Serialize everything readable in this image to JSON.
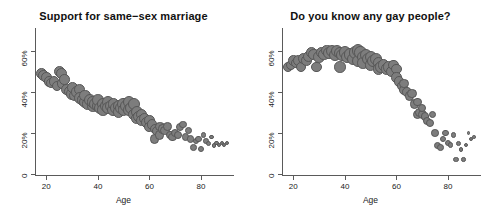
{
  "figure": {
    "background": "#ffffff",
    "point_fill": "#7d7d7d",
    "point_stroke": "#575757"
  },
  "panels": [
    {
      "id": "support-same-sex-marriage",
      "title": "Support for same−sex marriage",
      "xlabel": "Age",
      "yticks": [
        "0",
        "20%",
        "40%",
        "60%"
      ],
      "xticks": [
        "20",
        "40",
        "60",
        "80"
      ]
    },
    {
      "id": "know-any-gay-people",
      "title": "Do you know any gay people?",
      "xlabel": "Age",
      "yticks": [
        "0",
        "20%",
        "40%",
        "60%"
      ],
      "xticks": [
        "20",
        "40",
        "60",
        "80"
      ]
    }
  ],
  "chart_data": [
    {
      "type": "scatter",
      "title": "Support for same−sex marriage",
      "xlabel": "Age",
      "ylabel": "",
      "xlim": [
        16,
        92
      ],
      "ylim": [
        0,
        70
      ],
      "ytick_values": [
        0,
        20,
        40,
        60
      ],
      "ytick_labels": [
        "0",
        "20%",
        "40%",
        "60%"
      ],
      "xtick_values": [
        20,
        40,
        60,
        80
      ],
      "xtick_labels": [
        "20",
        "40",
        "60",
        "80"
      ],
      "grid": false,
      "legend": null,
      "size_encoding": "bubble area proportional to sample size (respondents per age)",
      "points": [
        {
          "x": 18,
          "y": 49,
          "s": 5.4
        },
        {
          "x": 19,
          "y": 48,
          "s": 5.4
        },
        {
          "x": 20,
          "y": 47,
          "s": 5.2
        },
        {
          "x": 21,
          "y": 45,
          "s": 5.2
        },
        {
          "x": 22,
          "y": 44,
          "s": 5.0
        },
        {
          "x": 23,
          "y": 45,
          "s": 5.2
        },
        {
          "x": 24,
          "y": 43,
          "s": 5.0
        },
        {
          "x": 25,
          "y": 50,
          "s": 5.6
        },
        {
          "x": 26,
          "y": 49,
          "s": 5.4
        },
        {
          "x": 26,
          "y": 44,
          "s": 5.2
        },
        {
          "x": 27,
          "y": 46,
          "s": 5.2
        },
        {
          "x": 28,
          "y": 41,
          "s": 5.6
        },
        {
          "x": 29,
          "y": 40,
          "s": 5.4
        },
        {
          "x": 30,
          "y": 39,
          "s": 5.8
        },
        {
          "x": 30,
          "y": 42,
          "s": 5.4
        },
        {
          "x": 31,
          "y": 38,
          "s": 5.6
        },
        {
          "x": 32,
          "y": 40,
          "s": 5.8
        },
        {
          "x": 33,
          "y": 41,
          "s": 5.6
        },
        {
          "x": 33,
          "y": 37,
          "s": 5.8
        },
        {
          "x": 34,
          "y": 36,
          "s": 5.6
        },
        {
          "x": 35,
          "y": 35,
          "s": 6.0
        },
        {
          "x": 35,
          "y": 38,
          "s": 5.6
        },
        {
          "x": 36,
          "y": 34,
          "s": 5.8
        },
        {
          "x": 37,
          "y": 36,
          "s": 6.0
        },
        {
          "x": 38,
          "y": 33,
          "s": 5.8
        },
        {
          "x": 38,
          "y": 35,
          "s": 5.6
        },
        {
          "x": 39,
          "y": 34,
          "s": 6.0
        },
        {
          "x": 40,
          "y": 33,
          "s": 6.2
        },
        {
          "x": 40,
          "y": 36,
          "s": 5.8
        },
        {
          "x": 41,
          "y": 32,
          "s": 6.0
        },
        {
          "x": 42,
          "y": 34,
          "s": 6.2
        },
        {
          "x": 42,
          "y": 31,
          "s": 5.8
        },
        {
          "x": 43,
          "y": 33,
          "s": 6.0
        },
        {
          "x": 44,
          "y": 35,
          "s": 6.2
        },
        {
          "x": 44,
          "y": 32,
          "s": 5.8
        },
        {
          "x": 45,
          "y": 33,
          "s": 6.2
        },
        {
          "x": 46,
          "y": 31,
          "s": 6.0
        },
        {
          "x": 46,
          "y": 34,
          "s": 5.8
        },
        {
          "x": 47,
          "y": 32,
          "s": 6.2
        },
        {
          "x": 48,
          "y": 33,
          "s": 6.0
        },
        {
          "x": 48,
          "y": 30,
          "s": 5.8
        },
        {
          "x": 49,
          "y": 32,
          "s": 6.0
        },
        {
          "x": 50,
          "y": 34,
          "s": 6.2
        },
        {
          "x": 50,
          "y": 31,
          "s": 5.8
        },
        {
          "x": 51,
          "y": 33,
          "s": 6.0
        },
        {
          "x": 52,
          "y": 35,
          "s": 6.2
        },
        {
          "x": 52,
          "y": 31,
          "s": 5.8
        },
        {
          "x": 53,
          "y": 32,
          "s": 6.2
        },
        {
          "x": 54,
          "y": 34,
          "s": 6.0
        },
        {
          "x": 54,
          "y": 29,
          "s": 5.8
        },
        {
          "x": 55,
          "y": 30,
          "s": 6.0
        },
        {
          "x": 55,
          "y": 27,
          "s": 5.6
        },
        {
          "x": 56,
          "y": 28,
          "s": 5.8
        },
        {
          "x": 57,
          "y": 29,
          "s": 5.6
        },
        {
          "x": 57,
          "y": 26,
          "s": 5.4
        },
        {
          "x": 58,
          "y": 27,
          "s": 5.6
        },
        {
          "x": 59,
          "y": 25,
          "s": 5.4
        },
        {
          "x": 60,
          "y": 26,
          "s": 5.2
        },
        {
          "x": 60,
          "y": 23,
          "s": 5.0
        },
        {
          "x": 61,
          "y": 24,
          "s": 5.2
        },
        {
          "x": 62,
          "y": 22,
          "s": 5.0
        },
        {
          "x": 62,
          "y": 17,
          "s": 4.8
        },
        {
          "x": 63,
          "y": 21,
          "s": 5.0
        },
        {
          "x": 64,
          "y": 23,
          "s": 4.8
        },
        {
          "x": 64,
          "y": 19,
          "s": 4.6
        },
        {
          "x": 65,
          "y": 22,
          "s": 4.8
        },
        {
          "x": 66,
          "y": 21,
          "s": 4.6
        },
        {
          "x": 67,
          "y": 23,
          "s": 4.4
        },
        {
          "x": 68,
          "y": 19,
          "s": 4.4
        },
        {
          "x": 69,
          "y": 18,
          "s": 4.2
        },
        {
          "x": 70,
          "y": 20,
          "s": 4.2
        },
        {
          "x": 71,
          "y": 19,
          "s": 4.0
        },
        {
          "x": 72,
          "y": 23,
          "s": 4.0
        },
        {
          "x": 73,
          "y": 24,
          "s": 3.8
        },
        {
          "x": 74,
          "y": 18,
          "s": 3.8
        },
        {
          "x": 75,
          "y": 21,
          "s": 3.6
        },
        {
          "x": 76,
          "y": 17,
          "s": 3.6
        },
        {
          "x": 77,
          "y": 13,
          "s": 3.4
        },
        {
          "x": 78,
          "y": 16,
          "s": 3.2
        },
        {
          "x": 79,
          "y": 17,
          "s": 3.2
        },
        {
          "x": 80,
          "y": 12,
          "s": 3.0
        },
        {
          "x": 81,
          "y": 19,
          "s": 2.8
        },
        {
          "x": 82,
          "y": 16,
          "s": 2.8
        },
        {
          "x": 83,
          "y": 15,
          "s": 2.6
        },
        {
          "x": 84,
          "y": 18,
          "s": 2.2
        },
        {
          "x": 85,
          "y": 14,
          "s": 2.4
        },
        {
          "x": 86,
          "y": 15,
          "s": 2.2
        },
        {
          "x": 87,
          "y": 14,
          "s": 2.2
        },
        {
          "x": 88,
          "y": 15,
          "s": 2.0
        },
        {
          "x": 89,
          "y": 14,
          "s": 2.2
        },
        {
          "x": 90,
          "y": 15,
          "s": 2.2
        }
      ]
    },
    {
      "type": "scatter",
      "title": "Do you know any gay people?",
      "xlabel": "Age",
      "ylabel": "",
      "xlim": [
        16,
        92
      ],
      "ylim": [
        0,
        70
      ],
      "ytick_values": [
        0,
        20,
        40,
        60
      ],
      "ytick_labels": [
        "0",
        "20%",
        "40%",
        "60%"
      ],
      "xtick_values": [
        20,
        40,
        60,
        80
      ],
      "xtick_labels": [
        "20",
        "40",
        "60",
        "80"
      ],
      "grid": false,
      "legend": null,
      "size_encoding": "bubble area proportional to sample size (respondents per age)",
      "points": [
        {
          "x": 18,
          "y": 52,
          "s": 5.2
        },
        {
          "x": 19,
          "y": 53,
          "s": 5.2
        },
        {
          "x": 20,
          "y": 55,
          "s": 5.4
        },
        {
          "x": 21,
          "y": 54,
          "s": 5.2
        },
        {
          "x": 22,
          "y": 55,
          "s": 5.4
        },
        {
          "x": 23,
          "y": 52,
          "s": 5.2
        },
        {
          "x": 24,
          "y": 56,
          "s": 5.4
        },
        {
          "x": 25,
          "y": 55,
          "s": 5.4
        },
        {
          "x": 26,
          "y": 57,
          "s": 5.6
        },
        {
          "x": 27,
          "y": 59,
          "s": 5.6
        },
        {
          "x": 28,
          "y": 58,
          "s": 5.6
        },
        {
          "x": 29,
          "y": 52,
          "s": 5.4
        },
        {
          "x": 30,
          "y": 57,
          "s": 5.8
        },
        {
          "x": 31,
          "y": 59,
          "s": 5.8
        },
        {
          "x": 32,
          "y": 58,
          "s": 5.8
        },
        {
          "x": 33,
          "y": 60,
          "s": 5.8
        },
        {
          "x": 34,
          "y": 59,
          "s": 6.0
        },
        {
          "x": 35,
          "y": 60,
          "s": 6.0
        },
        {
          "x": 36,
          "y": 58,
          "s": 6.0
        },
        {
          "x": 37,
          "y": 60,
          "s": 6.0
        },
        {
          "x": 38,
          "y": 59,
          "s": 6.0
        },
        {
          "x": 38,
          "y": 52,
          "s": 5.8
        },
        {
          "x": 39,
          "y": 58,
          "s": 6.0
        },
        {
          "x": 40,
          "y": 59,
          "s": 6.2
        },
        {
          "x": 41,
          "y": 57,
          "s": 6.0
        },
        {
          "x": 42,
          "y": 58,
          "s": 6.2
        },
        {
          "x": 43,
          "y": 56,
          "s": 6.0
        },
        {
          "x": 44,
          "y": 59,
          "s": 6.2
        },
        {
          "x": 45,
          "y": 60,
          "s": 6.2
        },
        {
          "x": 45,
          "y": 55,
          "s": 6.0
        },
        {
          "x": 46,
          "y": 59,
          "s": 6.2
        },
        {
          "x": 47,
          "y": 57,
          "s": 6.0
        },
        {
          "x": 47,
          "y": 54,
          "s": 5.8
        },
        {
          "x": 48,
          "y": 58,
          "s": 6.0
        },
        {
          "x": 49,
          "y": 56,
          "s": 6.0
        },
        {
          "x": 50,
          "y": 57,
          "s": 6.0
        },
        {
          "x": 50,
          "y": 53,
          "s": 5.8
        },
        {
          "x": 51,
          "y": 55,
          "s": 6.0
        },
        {
          "x": 52,
          "y": 56,
          "s": 5.8
        },
        {
          "x": 53,
          "y": 54,
          "s": 5.8
        },
        {
          "x": 53,
          "y": 51,
          "s": 5.6
        },
        {
          "x": 54,
          "y": 52,
          "s": 5.8
        },
        {
          "x": 55,
          "y": 53,
          "s": 5.6
        },
        {
          "x": 56,
          "y": 51,
          "s": 5.6
        },
        {
          "x": 57,
          "y": 52,
          "s": 5.6
        },
        {
          "x": 58,
          "y": 50,
          "s": 5.4
        },
        {
          "x": 59,
          "y": 53,
          "s": 5.4
        },
        {
          "x": 60,
          "y": 51,
          "s": 5.2
        },
        {
          "x": 60,
          "y": 47,
          "s": 5.2
        },
        {
          "x": 61,
          "y": 45,
          "s": 5.2
        },
        {
          "x": 62,
          "y": 43,
          "s": 5.0
        },
        {
          "x": 63,
          "y": 41,
          "s": 5.0
        },
        {
          "x": 63,
          "y": 44,
          "s": 4.8
        },
        {
          "x": 64,
          "y": 40,
          "s": 4.8
        },
        {
          "x": 65,
          "y": 38,
          "s": 4.8
        },
        {
          "x": 66,
          "y": 39,
          "s": 4.6
        },
        {
          "x": 67,
          "y": 34,
          "s": 4.6
        },
        {
          "x": 68,
          "y": 29,
          "s": 4.6
        },
        {
          "x": 68,
          "y": 35,
          "s": 4.4
        },
        {
          "x": 69,
          "y": 30,
          "s": 4.4
        },
        {
          "x": 70,
          "y": 29,
          "s": 4.4
        },
        {
          "x": 70,
          "y": 32,
          "s": 4.2
        },
        {
          "x": 71,
          "y": 28,
          "s": 4.2
        },
        {
          "x": 72,
          "y": 26,
          "s": 4.0
        },
        {
          "x": 73,
          "y": 25,
          "s": 4.0
        },
        {
          "x": 74,
          "y": 29,
          "s": 3.8
        },
        {
          "x": 75,
          "y": 20,
          "s": 3.8
        },
        {
          "x": 76,
          "y": 14,
          "s": 3.6
        },
        {
          "x": 77,
          "y": 13,
          "s": 3.4
        },
        {
          "x": 78,
          "y": 17,
          "s": 3.2
        },
        {
          "x": 79,
          "y": 20,
          "s": 3.2
        },
        {
          "x": 80,
          "y": 15,
          "s": 3.0
        },
        {
          "x": 81,
          "y": 14,
          "s": 2.8
        },
        {
          "x": 82,
          "y": 19,
          "s": 2.6
        },
        {
          "x": 83,
          "y": 7,
          "s": 2.8
        },
        {
          "x": 84,
          "y": 15,
          "s": 2.4
        },
        {
          "x": 85,
          "y": 12,
          "s": 2.4
        },
        {
          "x": 86,
          "y": 7,
          "s": 2.2
        },
        {
          "x": 87,
          "y": 14,
          "s": 2.2
        },
        {
          "x": 88,
          "y": 20,
          "s": 1.8
        },
        {
          "x": 89,
          "y": 17,
          "s": 2.0
        },
        {
          "x": 90,
          "y": 18,
          "s": 1.8
        }
      ]
    }
  ]
}
